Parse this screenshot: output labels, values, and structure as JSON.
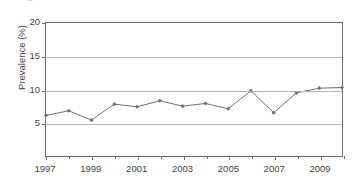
{
  "figure": {
    "top_artifact_glyph": "a",
    "background_color": "#ffffff",
    "line_color": "#6e6e6e",
    "grid_color": "#b3b3b3",
    "axis_color": "#6e6e6e"
  },
  "chart_data": {
    "type": "line",
    "title": "",
    "xlabel": "",
    "ylabel": "Prevalence (%)",
    "xlim": [
      1997,
      2010
    ],
    "ylim": [
      0,
      20
    ],
    "yticks": [
      20,
      15,
      10,
      5
    ],
    "ytick_labels": [
      "20",
      "15",
      "10",
      "5"
    ],
    "xticks": [
      1997,
      1999,
      2001,
      2003,
      2005,
      2007,
      2009
    ],
    "xtick_labels": [
      "1997",
      "1999",
      "2001",
      "2003",
      "2005",
      "2007",
      "2009"
    ],
    "minor_xticks": [
      1998,
      2000,
      2002,
      2004,
      2006,
      2008,
      2010
    ],
    "grid": "horizontal",
    "legend": "none",
    "marker": "diamond",
    "x": [
      1997,
      1998,
      1999,
      2000,
      2001,
      2002,
      2003,
      2004,
      2005,
      2006,
      2007,
      2008,
      2009,
      2010
    ],
    "values": [
      6.1,
      6.8,
      5.4,
      7.8,
      7.4,
      8.3,
      7.5,
      7.9,
      7.1,
      9.8,
      6.5,
      9.5,
      10.2,
      10.3
    ],
    "series": [
      {
        "name": "Prevalence",
        "values": [
          6.1,
          6.8,
          5.4,
          7.8,
          7.4,
          8.3,
          7.5,
          7.9,
          7.1,
          9.8,
          6.5,
          9.5,
          10.2,
          10.3
        ]
      }
    ]
  }
}
